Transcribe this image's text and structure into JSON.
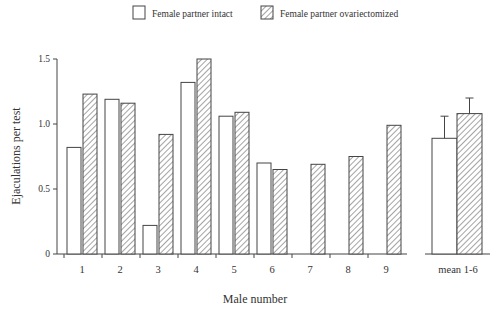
{
  "legend": {
    "intact_label": "Female partner intact",
    "ovx_label": "Female partner ovariectomized"
  },
  "chart_data": {
    "type": "bar",
    "title": "",
    "xlabel": "Male number",
    "ylabel": "Ejaculations per test",
    "ylim": [
      0,
      1.5
    ],
    "yticks": [
      "0",
      "0.5",
      "1.0",
      "1.5"
    ],
    "grid": false,
    "legend_position": "top",
    "categories": [
      "1",
      "2",
      "3",
      "4",
      "5",
      "6",
      "7",
      "8",
      "9"
    ],
    "series": [
      {
        "name": "Female partner intact",
        "fill": "white",
        "values": [
          0.82,
          1.19,
          0.22,
          1.32,
          1.06,
          0.7,
          0,
          0,
          0
        ]
      },
      {
        "name": "Female partner ovariectomized",
        "fill": "hatched",
        "values": [
          1.23,
          1.16,
          0.92,
          1.5,
          1.09,
          0.65,
          0.69,
          0.75,
          0.99
        ]
      }
    ],
    "mean_panel": {
      "label": "mean 1-6",
      "intact": {
        "mean": 0.89,
        "error_top": 1.06
      },
      "ovx": {
        "mean": 1.08,
        "error_top": 1.2
      }
    }
  }
}
